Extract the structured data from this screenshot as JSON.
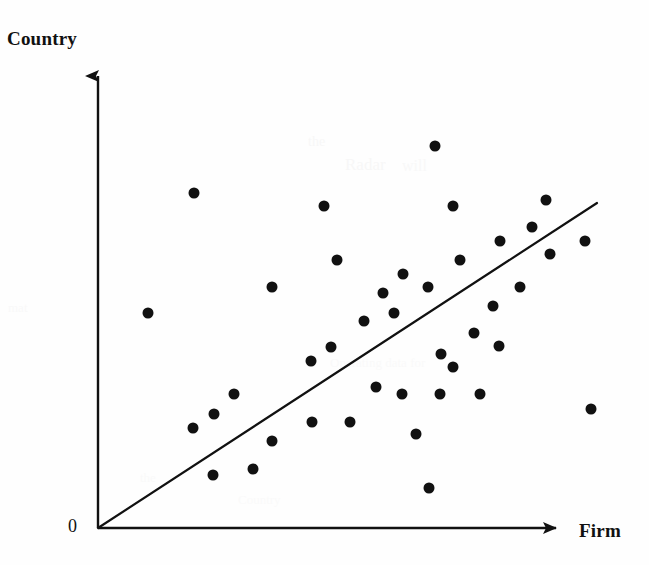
{
  "figure": {
    "background_color": "#fefefe",
    "ink_color": "#111111",
    "width": 649,
    "height": 565
  },
  "axes": {
    "y_label": "Country",
    "x_label": "Firm",
    "origin_label": "0",
    "origin_x": 98,
    "origin_y": 528,
    "y_axis_top": 62,
    "x_axis_right": 568,
    "arrow_style": "solid-triangle",
    "line_color": "#111111"
  },
  "chart_data": {
    "type": "scatter",
    "title": "",
    "xlabel": "Firm",
    "ylabel": "Country",
    "grid": false,
    "legend": null,
    "axis_ticks": {
      "x": [],
      "y": [],
      "origin": "0"
    },
    "xlim": [
      0,
      100
    ],
    "ylim": [
      0,
      100
    ],
    "marker": {
      "shape": "circle",
      "color": "#111111",
      "diameter_px": 11
    },
    "points_px": [
      [
        435,
        146
      ],
      [
        194,
        193
      ],
      [
        324,
        206
      ],
      [
        453,
        206
      ],
      [
        546,
        200
      ],
      [
        532,
        227
      ],
      [
        500,
        241
      ],
      [
        585,
        241
      ],
      [
        550,
        254
      ],
      [
        337,
        260
      ],
      [
        460,
        260
      ],
      [
        403,
        274
      ],
      [
        272,
        287
      ],
      [
        428,
        287
      ],
      [
        520,
        287
      ],
      [
        383,
        293
      ],
      [
        493,
        306
      ],
      [
        148,
        313
      ],
      [
        394,
        313
      ],
      [
        364,
        321
      ],
      [
        474,
        333
      ],
      [
        499,
        346
      ],
      [
        331,
        347
      ],
      [
        441,
        354
      ],
      [
        311,
        361
      ],
      [
        453,
        367
      ],
      [
        376,
        387
      ],
      [
        234,
        394
      ],
      [
        402,
        394
      ],
      [
        440,
        394
      ],
      [
        480,
        394
      ],
      [
        591,
        409
      ],
      [
        214,
        414
      ],
      [
        312,
        422
      ],
      [
        350,
        422
      ],
      [
        193,
        428
      ],
      [
        416,
        434
      ],
      [
        272,
        441
      ],
      [
        253,
        469
      ],
      [
        213,
        475
      ],
      [
        429,
        488
      ]
    ],
    "x": [
      71.7,
      20.4,
      48.1,
      75.5,
      95.3,
      92.3,
      85.5,
      103.6,
      96.2,
      50.9,
      77.0,
      64.9,
      37.0,
      70.2,
      89.8,
      60.6,
      83.9,
      10.6,
      63.0,
      56.6,
      80.0,
      85.3,
      49.6,
      73.0,
      45.3,
      75.5,
      59.1,
      28.9,
      64.5,
      72.6,
      81.3,
      104.9,
      24.7,
      45.5,
      53.6,
      20.2,
      67.7,
      37.0,
      33.0,
      24.5,
      70.4
    ],
    "y": [
      83.4,
      78.1,
      75.7,
      75.7,
      77.1,
      72.4,
      70.5,
      70.5,
      68.8,
      67.8,
      67.8,
      64.8,
      62.3,
      62.3,
      62.3,
      61.1,
      58.9,
      57.3,
      57.3,
      55.6,
      53.0,
      50.5,
      50.3,
      48.9,
      47.4,
      46.2,
      40.4,
      39.0,
      39.0,
      39.0,
      39.0,
      27.9,
      26.9,
      24.8,
      24.8,
      23.2,
      22.1,
      20.9,
      14.6,
      12.9,
      10.1
    ],
    "point_count": 41,
    "trend_line": {
      "type": "linear",
      "description": "45-degree reference line through origin",
      "x0_px": 98,
      "y0_px": 528,
      "x1_px": 597,
      "y1_px": 203,
      "color": "#111111",
      "width_px": 2.2
    }
  },
  "artifacts": [
    {
      "text": "the",
      "left": 308,
      "top": 134,
      "size": 14,
      "opacity": 0.3
    },
    {
      "text": "Radar",
      "left": 345,
      "top": 155,
      "size": 17,
      "opacity": 0.3
    },
    {
      "text": "will",
      "left": 402,
      "top": 157,
      "size": 16,
      "opacity": 0.26
    },
    {
      "text": "mat",
      "left": 8,
      "top": 300,
      "size": 13,
      "opacity": 0.22
    },
    {
      "text": "Operating data for",
      "left": 330,
      "top": 355,
      "size": 13,
      "opacity": 0.2
    },
    {
      "text": "the",
      "left": 140,
      "top": 470,
      "size": 13,
      "opacity": 0.2
    },
    {
      "text": "Country",
      "left": 238,
      "top": 492,
      "size": 13,
      "opacity": 0.18
    }
  ]
}
